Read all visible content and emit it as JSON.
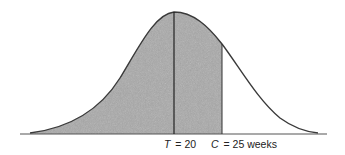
{
  "figure": {
    "type": "normal-distribution-diagram",
    "shaded_region": "area under curve from left tail up to C",
    "colors": {
      "curve": "#3a3a3a",
      "shade": "#a9a9a9",
      "axis": "#555555",
      "background": "#ffffff"
    },
    "markers": [
      {
        "symbol": "T",
        "equals": "= 20",
        "value": 20,
        "role": "mean"
      },
      {
        "symbol": "C",
        "equals": "= 25 weeks",
        "value": 25,
        "role": "cutoff"
      }
    ]
  }
}
